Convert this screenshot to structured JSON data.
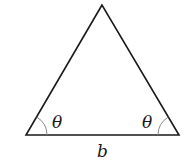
{
  "diagram": {
    "type": "isosceles-triangle",
    "labels": {
      "left_angle": "θ",
      "right_angle": "θ",
      "base": "b"
    },
    "colors": {
      "stroke": "#1a1a1a",
      "arc": "#888888",
      "background": "#ffffff"
    }
  }
}
